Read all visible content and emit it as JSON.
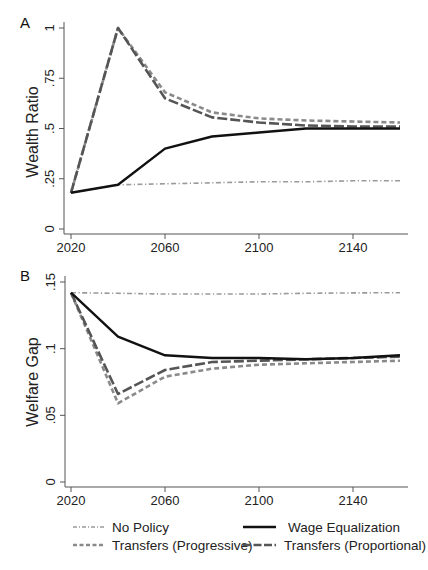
{
  "colors": {
    "no_policy": "#9a9a9a",
    "wage_equalization": "#111111",
    "transfers_progressive": "#8a8a8a",
    "transfers_proportional": "#555555",
    "axis": "#555555",
    "text": "#222222"
  },
  "legend": {
    "items": [
      {
        "key": "no_policy",
        "label": "No Policy"
      },
      {
        "key": "wage_equalization",
        "label": "Wage Equalization"
      },
      {
        "key": "transfers_progressive",
        "label": "Transfers (Progressive)"
      },
      {
        "key": "transfers_proportional",
        "label": "Transfers (Proportional)"
      }
    ]
  },
  "chart_data": [
    {
      "panel_label": "A",
      "type": "line",
      "title": "",
      "xlabel": "",
      "ylabel": "Wealth Ratio",
      "x": [
        2020,
        2040,
        2060,
        2080,
        2100,
        2120,
        2140,
        2160
      ],
      "xticks": [
        2020,
        2060,
        2100,
        2140
      ],
      "xtick_labels": [
        "2020",
        "2060",
        "2100",
        "2140"
      ],
      "yticks": [
        0,
        0.25,
        0.5,
        0.75,
        1
      ],
      "ytick_labels": [
        "0",
        ".25",
        ".5",
        ".75",
        "1"
      ],
      "xlim": [
        2020,
        2160
      ],
      "ylim": [
        0,
        1
      ],
      "grid": false,
      "legend_position": "bottom",
      "series": [
        {
          "key": "no_policy",
          "name": "No Policy",
          "values": [
            0.18,
            0.22,
            0.225,
            0.23,
            0.235,
            0.235,
            0.24,
            0.24
          ]
        },
        {
          "key": "wage_equalization",
          "name": "Wage Equalization",
          "values": [
            0.18,
            0.22,
            0.4,
            0.46,
            0.48,
            0.5,
            0.5,
            0.5
          ]
        },
        {
          "key": "transfers_progressive",
          "name": "Transfers (Progressive)",
          "values": [
            0.18,
            1.0,
            0.68,
            0.58,
            0.55,
            0.54,
            0.535,
            0.53
          ]
        },
        {
          "key": "transfers_proportional",
          "name": "Transfers (Proportional)",
          "values": [
            0.18,
            1.0,
            0.65,
            0.555,
            0.53,
            0.515,
            0.51,
            0.51
          ]
        }
      ]
    },
    {
      "panel_label": "B",
      "type": "line",
      "title": "",
      "xlabel": "",
      "ylabel": "Welfare Gap",
      "x": [
        2020,
        2040,
        2060,
        2080,
        2100,
        2120,
        2140,
        2160
      ],
      "xticks": [
        2020,
        2060,
        2100,
        2140
      ],
      "xtick_labels": [
        "2020",
        "2060",
        "2100",
        "2140"
      ],
      "yticks": [
        0,
        0.05,
        0.1,
        0.15
      ],
      "ytick_labels": [
        "0",
        ".05",
        ".1",
        ".15"
      ],
      "xlim": [
        2020,
        2160
      ],
      "ylim": [
        0,
        0.15
      ],
      "grid": false,
      "legend_position": "bottom",
      "series": [
        {
          "key": "no_policy",
          "name": "No Policy",
          "values": [
            0.142,
            0.1415,
            0.141,
            0.141,
            0.141,
            0.1415,
            0.1418,
            0.142
          ]
        },
        {
          "key": "wage_equalization",
          "name": "Wage Equalization",
          "values": [
            0.142,
            0.109,
            0.095,
            0.093,
            0.093,
            0.092,
            0.093,
            0.095
          ]
        },
        {
          "key": "transfers_progressive",
          "name": "Transfers (Progressive)",
          "values": [
            0.142,
            0.059,
            0.079,
            0.085,
            0.088,
            0.089,
            0.09,
            0.091
          ]
        },
        {
          "key": "transfers_proportional",
          "name": "Transfers (Proportional)",
          "values": [
            0.142,
            0.066,
            0.084,
            0.09,
            0.091,
            0.092,
            0.093,
            0.094
          ]
        }
      ]
    }
  ]
}
